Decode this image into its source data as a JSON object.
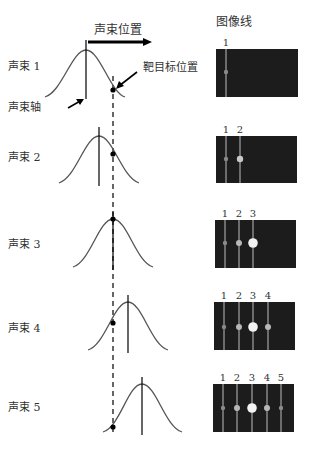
{
  "header": {
    "beam_position_label": "声束位置",
    "image_lines_label": "图像线"
  },
  "annotations": {
    "beam_axis": "声束轴",
    "target_position": "靶目标位置"
  },
  "beams": [
    {
      "label": "声束 1",
      "axis_x": 86,
      "peak_y": 50,
      "base_y": 97,
      "target_y": 90,
      "image_lines": [
        "1"
      ]
    },
    {
      "label": "声束 2",
      "axis_x": 99,
      "peak_y": 136,
      "base_y": 183,
      "target_y": 154,
      "image_lines": [
        "1",
        "2"
      ]
    },
    {
      "label": "声束 3",
      "axis_x": 113,
      "peak_y": 219,
      "base_y": 267,
      "target_y": 219,
      "image_lines": [
        "1",
        "2",
        "3"
      ]
    },
    {
      "label": "声束 4",
      "axis_x": 128,
      "peak_y": 302,
      "base_y": 350,
      "target_y": 323,
      "image_lines": [
        "1",
        "2",
        "3",
        "4"
      ]
    },
    {
      "label": "声束 5",
      "axis_x": 142,
      "peak_y": 384,
      "base_y": 432,
      "target_y": 427,
      "image_lines": [
        "1",
        "2",
        "3",
        "4",
        "5"
      ]
    }
  ],
  "target_x": 113,
  "colors": {
    "panel_bg": "#1c1c1c",
    "line": "#bdbdbd",
    "curve": "#555555",
    "dot": "#d0d0d0"
  }
}
